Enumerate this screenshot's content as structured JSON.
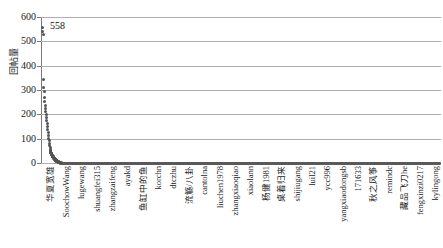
{
  "chart_data": {
    "type": "scatter",
    "title": "",
    "xlabel": "",
    "ylabel": "回帖量",
    "ylim": [
      0,
      600
    ],
    "yticks": [
      0,
      100,
      200,
      300,
      400,
      500,
      600
    ],
    "ytick_labels": [
      "0",
      "100",
      "200",
      "300",
      "400",
      "500",
      "600"
    ],
    "grid": "horizontal",
    "legend": "none",
    "annotations": [
      {
        "text": "558",
        "x_index": 0,
        "value": 558
      }
    ],
    "categories": [
      "华夏宽雄",
      "SoochowWang",
      "lugewang",
      "shuangfei315",
      "zhangzaifeng",
      "ayakd",
      "鱼缸中的鱼",
      "korchn",
      "dtczhu",
      "流觞/八卦",
      "cantolna",
      "liuchen1978",
      "zhangxiaoqiao",
      "xiaolann",
      "杨健1981",
      "桌着归来",
      "shijiugang",
      "luil21",
      "ycc996",
      "yangxiaodongsb",
      "171633",
      "秋之风筝",
      "remindc",
      "藏品飞刀he",
      "fengxinzi0217",
      "kylingong"
    ],
    "values": [
      558,
      540,
      530,
      345,
      310,
      295,
      268,
      252,
      238,
      225,
      212,
      200,
      188,
      175,
      162,
      150,
      138,
      126,
      114,
      102,
      92,
      82,
      73,
      64,
      56,
      49
    ],
    "tail_note": "long tail of several hundred additional users with values near 0 spanning the remaining plot width",
    "distribution": "power-law long tail"
  }
}
